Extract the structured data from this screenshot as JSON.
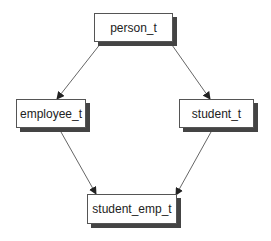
{
  "diagram": {
    "type": "class-hierarchy",
    "nodes": [
      {
        "id": "person_t",
        "label": "person_t"
      },
      {
        "id": "employee_t",
        "label": "employee_t"
      },
      {
        "id": "student_t",
        "label": "student_t"
      },
      {
        "id": "student_emp_t",
        "label": "student_emp_t"
      }
    ],
    "edges": [
      {
        "from": "person_t",
        "to": "employee_t"
      },
      {
        "from": "person_t",
        "to": "student_t"
      },
      {
        "from": "employee_t",
        "to": "student_emp_t"
      },
      {
        "from": "student_t",
        "to": "student_emp_t"
      }
    ]
  },
  "colors": {
    "edge": "#555555",
    "shadow": "#444444",
    "box_fill": "#ffffff"
  }
}
